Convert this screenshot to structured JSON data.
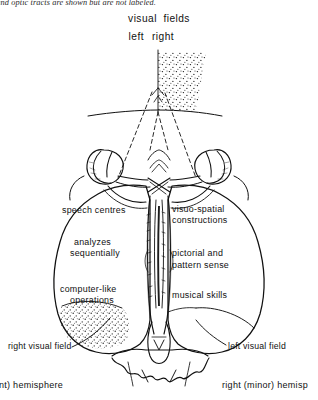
{
  "figure": {
    "caption_top": "s) and optic tracts are shown but are not labeled.",
    "title_visual_fields": "visual  fields",
    "field_left": "left",
    "field_right": "right"
  },
  "labels": {
    "left_hemisphere": [
      "speech centres",
      "analyzes",
      "sequentially",
      "computer-like",
      "operations"
    ],
    "right_hemisphere": [
      "visuo-spatial",
      "constructions",
      "pictorial and",
      "pattern sense",
      "musical skills"
    ],
    "right_visual_field": "right visual field",
    "left_visual_field": "left visual field"
  },
  "footer": {
    "left": "inant) hemisphere",
    "right": "right (minor) hemisp"
  },
  "colors": {
    "ink": "#111111",
    "paper": "#ffffff",
    "stipple": "#1a1a1a"
  }
}
